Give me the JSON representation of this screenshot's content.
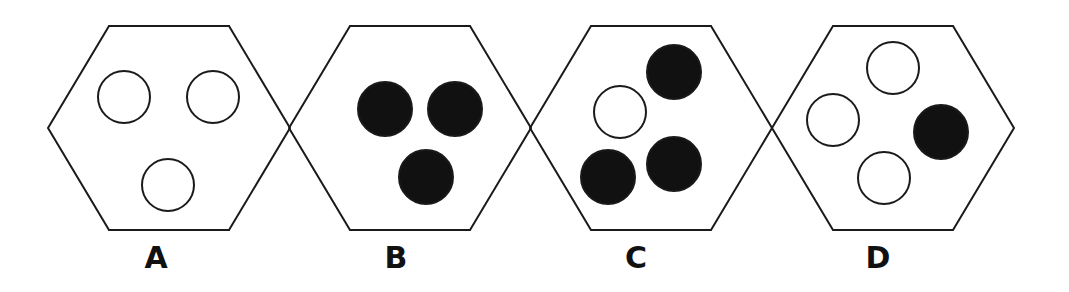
{
  "figure": {
    "stroke_color": "#1a1a1a",
    "fill_color": "#111111",
    "options": [
      {
        "label": "A",
        "hexagon": {
          "cx": 169,
          "cy": 128
        },
        "circles": [
          {
            "x": 124,
            "y": 97,
            "filled": false
          },
          {
            "x": 213,
            "y": 97,
            "filled": false
          },
          {
            "x": 168,
            "y": 185,
            "filled": false
          }
        ]
      },
      {
        "label": "B",
        "hexagon": {
          "cx": 410,
          "cy": 128
        },
        "circles": [
          {
            "x": 385,
            "y": 109,
            "filled": true
          },
          {
            "x": 455,
            "y": 109,
            "filled": true
          },
          {
            "x": 426,
            "y": 177,
            "filled": true
          }
        ]
      },
      {
        "label": "C",
        "hexagon": {
          "cx": 651,
          "cy": 128
        },
        "circles": [
          {
            "x": 620,
            "y": 112,
            "filled": false
          },
          {
            "x": 674,
            "y": 72,
            "filled": true
          },
          {
            "x": 608,
            "y": 177,
            "filled": true
          },
          {
            "x": 674,
            "y": 164,
            "filled": true
          }
        ]
      },
      {
        "label": "D",
        "hexagon": {
          "cx": 893,
          "cy": 128
        },
        "circles": [
          {
            "x": 893,
            "y": 68,
            "filled": false
          },
          {
            "x": 833,
            "y": 120,
            "filled": false
          },
          {
            "x": 884,
            "y": 178,
            "filled": false
          },
          {
            "x": 941,
            "y": 132,
            "filled": true
          }
        ]
      }
    ]
  }
}
